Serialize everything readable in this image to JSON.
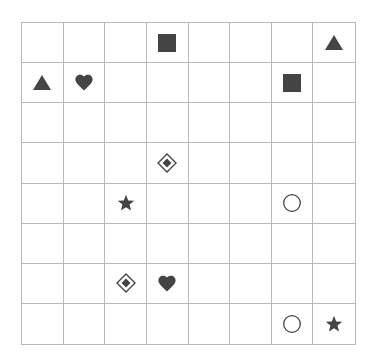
{
  "board": {
    "rows": 8,
    "cols": 8,
    "colors": {
      "grid": "#b8b8b8",
      "symbol": "#444444",
      "background": "#ffffff"
    },
    "pieces": [
      {
        "row": 0,
        "col": 3,
        "symbol": "square",
        "icon": "square-icon"
      },
      {
        "row": 0,
        "col": 7,
        "symbol": "triangle",
        "icon": "triangle-icon"
      },
      {
        "row": 1,
        "col": 0,
        "symbol": "triangle",
        "icon": "triangle-icon"
      },
      {
        "row": 1,
        "col": 1,
        "symbol": "heart",
        "icon": "heart-icon"
      },
      {
        "row": 1,
        "col": 6,
        "symbol": "square",
        "icon": "square-icon"
      },
      {
        "row": 3,
        "col": 3,
        "symbol": "diamond",
        "icon": "diamond-icon"
      },
      {
        "row": 4,
        "col": 2,
        "symbol": "star",
        "icon": "star-icon"
      },
      {
        "row": 4,
        "col": 6,
        "symbol": "circle",
        "icon": "circle-icon"
      },
      {
        "row": 6,
        "col": 2,
        "symbol": "diamond",
        "icon": "diamond-icon"
      },
      {
        "row": 6,
        "col": 3,
        "symbol": "heart",
        "icon": "heart-icon"
      },
      {
        "row": 7,
        "col": 6,
        "symbol": "circle",
        "icon": "circle-icon"
      },
      {
        "row": 7,
        "col": 7,
        "symbol": "star",
        "icon": "star-icon"
      }
    ]
  }
}
